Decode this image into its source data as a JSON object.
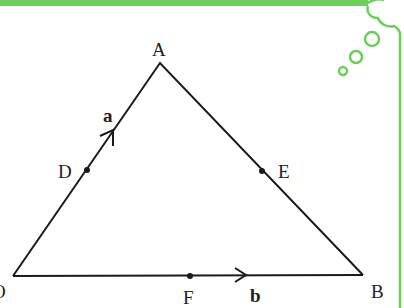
{
  "figure": {
    "type": "vector triangle diagram",
    "frame_color": "#6ccf5a",
    "line_color": "#1a1a1a",
    "vertices": [
      {
        "name": "A",
        "x": 160,
        "y": 63
      },
      {
        "name": "B",
        "x": 363,
        "y": 275
      },
      {
        "name": "O",
        "x": 13,
        "y": 276
      }
    ],
    "points": [
      {
        "name": "D",
        "on": "OA",
        "x": 87,
        "y": 170
      },
      {
        "name": "E",
        "on": "AB",
        "x": 262,
        "y": 171
      },
      {
        "name": "F",
        "on": "OB",
        "x": 190,
        "y": 276
      }
    ],
    "vectors": [
      {
        "label": "a",
        "along": "OA"
      },
      {
        "label": "b",
        "along": "OB"
      }
    ]
  },
  "labels": {
    "A": "A",
    "B": "B",
    "O": "O",
    "D": "D",
    "E": "E",
    "F": "F",
    "a": "a",
    "b": "b"
  }
}
